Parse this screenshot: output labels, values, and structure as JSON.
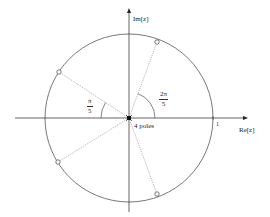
{
  "figure": {
    "type": "pole-zero plot (z-plane)",
    "axes": {
      "x_label": "Re[z]",
      "y_label": "Im[z]",
      "unit_tick_label": "1"
    },
    "unit_circle": {
      "radius": 1
    },
    "zeros": {
      "count": 4,
      "marker": "open-circle",
      "angles_rad": [
        "2π/5",
        "4π/5",
        "-4π/5",
        "-2π/5"
      ]
    },
    "poles": {
      "label": "4 poles",
      "location": "origin",
      "marker": "filled-square"
    },
    "angle_annotations": [
      {
        "numerator": "π",
        "denominator": "5"
      },
      {
        "numerator": "2π",
        "denominator": "5"
      }
    ],
    "colors": {
      "axis": "#222222",
      "circle": "#555555",
      "radial_lines": "#888888"
    }
  }
}
